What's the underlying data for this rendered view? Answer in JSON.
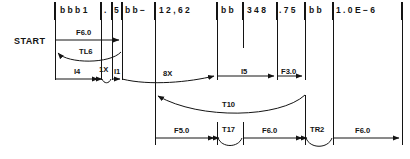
{
  "diagram": {
    "title": "START",
    "start_label": "START",
    "record_fields": [
      {
        "name": "field-1",
        "text": "b b b 1",
        "x": 57,
        "w": 44
      },
      {
        "name": "field-2",
        "text": ".",
        "x": 101,
        "w": 11
      },
      {
        "name": "field-3",
        "text": "5",
        "x": 112,
        "w": 10
      },
      {
        "name": "field-4",
        "text": "b b −",
        "x": 122,
        "w": 33
      },
      {
        "name": "field-5",
        "text": "1 2 , 6 2",
        "x": 155,
        "w": 62
      },
      {
        "name": "field-6",
        "text": "b b",
        "x": 217,
        "w": 26
      },
      {
        "name": "field-7",
        "text": "3 4 8",
        "x": 243,
        "w": 34
      },
      {
        "name": "field-8",
        "text": ". 7 5",
        "x": 277,
        "w": 28
      },
      {
        "name": "field-9",
        "text": "b b",
        "x": 305,
        "w": 28
      },
      {
        "name": "field-10",
        "text": "1 . 0 E − 6",
        "x": 333,
        "w": 69
      }
    ],
    "separators_x": [
      55,
      101,
      112,
      122,
      155,
      217,
      243,
      277,
      305,
      333,
      402
    ],
    "rows": [
      {
        "row": "row-1",
        "y": 40,
        "items": [
          {
            "name": "segment-f6-0",
            "label": "F6.0",
            "type": "arrow-right",
            "x1": 55,
            "x2": 122
          }
        ]
      },
      {
        "row": "row-2",
        "y": 57,
        "items": [
          {
            "name": "segment-tl6",
            "label": "TL6",
            "type": "curve-left-arrow",
            "x1": 55,
            "x2": 122
          }
        ]
      },
      {
        "row": "row-3",
        "y": 76,
        "items": [
          {
            "name": "segment-i4",
            "label": "I4",
            "type": "arrow-right",
            "x1": 55,
            "x2": 101
          },
          {
            "name": "segment-1x",
            "label": "1X",
            "type": "curve-small",
            "x1": 101,
            "x2": 112
          },
          {
            "name": "segment-i1",
            "label": "I1",
            "type": "arrow-right-short",
            "x1": 112,
            "x2": 122
          },
          {
            "name": "segment-8x",
            "label": "8X",
            "type": "curve-down-arrow",
            "x1": 122,
            "x2": 217
          },
          {
            "name": "segment-i5",
            "label": "I5",
            "type": "arrow-right",
            "x1": 217,
            "x2": 277
          },
          {
            "name": "segment-f3-0",
            "label": "F3.0",
            "type": "arrow-right",
            "x1": 277,
            "x2": 305
          }
        ]
      },
      {
        "row": "row-4",
        "y": 108,
        "items": [
          {
            "name": "segment-t10",
            "label": "T10",
            "type": "curve-arc-arrow",
            "x1": 155,
            "x2": 305
          }
        ]
      },
      {
        "row": "row-5",
        "y": 135,
        "items": [
          {
            "name": "segment-f5-0",
            "label": "F5.0",
            "type": "arrow-right",
            "x1": 155,
            "x2": 217
          },
          {
            "name": "segment-t17",
            "label": "T17",
            "type": "curve-small",
            "x1": 217,
            "x2": 243
          },
          {
            "name": "segment-f6-0-b",
            "label": "F6.0",
            "type": "arrow-right",
            "x1": 243,
            "x2": 305
          },
          {
            "name": "segment-tr2",
            "label": "TR2",
            "type": "curve-small",
            "x1": 305,
            "x2": 333
          },
          {
            "name": "segment-f6-0-c",
            "label": "F6.0",
            "type": "arrow-right",
            "x1": 333,
            "x2": 402
          }
        ]
      }
    ],
    "colors": {
      "ink": "#141414",
      "background": "#ffffff"
    }
  }
}
